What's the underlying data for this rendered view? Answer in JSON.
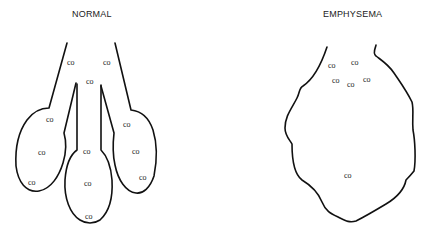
{
  "panels": {
    "normal": {
      "title": "NORMAL",
      "labels": [
        {
          "text": "CO",
          "x": 67,
          "y": 65
        },
        {
          "text": "CO",
          "x": 103,
          "y": 65
        },
        {
          "text": "CO",
          "x": 86,
          "y": 84
        },
        {
          "text": "CO",
          "x": 46,
          "y": 122
        },
        {
          "text": "CO",
          "x": 38,
          "y": 155
        },
        {
          "text": "CO",
          "x": 28,
          "y": 185
        },
        {
          "text": "CO",
          "x": 83,
          "y": 154
        },
        {
          "text": "CO",
          "x": 84,
          "y": 186
        },
        {
          "text": "CO",
          "x": 85,
          "y": 219
        },
        {
          "text": "CO",
          "x": 123,
          "y": 127
        },
        {
          "text": "CO",
          "x": 132,
          "y": 154
        },
        {
          "text": "CO",
          "x": 139,
          "y": 180
        }
      ]
    },
    "emphysema": {
      "title": "EMPHYSEMA",
      "labels": [
        {
          "text": "CO",
          "x": 328,
          "y": 68
        },
        {
          "text": "CO",
          "x": 351,
          "y": 65
        },
        {
          "text": "CO",
          "x": 332,
          "y": 83
        },
        {
          "text": "CO",
          "x": 347,
          "y": 87
        },
        {
          "text": "CO",
          "x": 363,
          "y": 82
        },
        {
          "text": "CO",
          "x": 344,
          "y": 178
        }
      ]
    }
  },
  "colors": {
    "line": "#111111",
    "text": "#1a1a1a",
    "background": "#ffffff"
  }
}
